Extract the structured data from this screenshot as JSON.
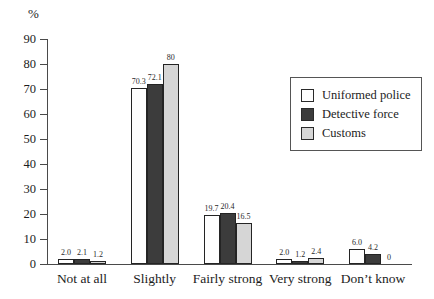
{
  "chart_data": {
    "type": "bar",
    "ylabel": "%",
    "ylim": [
      0,
      90
    ],
    "yticks": [
      0,
      10,
      20,
      30,
      40,
      50,
      60,
      70,
      80,
      90
    ],
    "grid": false,
    "legend_position": "upper-right-inside",
    "categories": [
      "Not at all",
      "Slightly",
      "Fairly strong",
      "Very strong",
      "Don’t know"
    ],
    "series": [
      {
        "name": "Uniformed police",
        "color": "#fefefe",
        "values": [
          2.0,
          70.3,
          19.7,
          2.0,
          6.0
        ],
        "value_labels": [
          "2.0",
          "70.3",
          "19.7",
          "2.0",
          "6.0"
        ]
      },
      {
        "name": "Detective force",
        "color": "#3c3c3c",
        "values": [
          2.1,
          72.1,
          20.4,
          1.2,
          4.2
        ],
        "value_labels": [
          "2.1",
          "72.1",
          "20.4",
          "1.2",
          "4.2"
        ]
      },
      {
        "name": "Customs",
        "color": "#d6d6d6",
        "values": [
          1.2,
          80,
          16.5,
          2.4,
          0
        ],
        "value_labels": [
          "1.2",
          "80",
          "16.5",
          "2.4",
          "0"
        ]
      }
    ]
  }
}
